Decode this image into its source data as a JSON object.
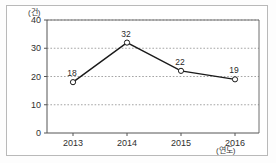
{
  "chart_data": {
    "type": "line",
    "title": "",
    "subtitle": "",
    "xlabel": "(연도)",
    "ylabel": "(건)",
    "categories": [
      "2013",
      "2014",
      "2015",
      "2016"
    ],
    "values": [
      18,
      32,
      22,
      19
    ],
    "series": [
      {
        "name": "건수",
        "values": [
          18,
          32,
          22,
          19
        ]
      }
    ],
    "point_labels": [
      "18",
      "32",
      "22",
      "19"
    ],
    "ylim": [
      0,
      40
    ],
    "yticks": [
      0,
      10,
      20,
      30,
      40
    ],
    "ytick_labels": [
      "0",
      "10",
      "20",
      "30",
      "40"
    ],
    "grid": true,
    "grid_style": "dotted-horizontal",
    "legend": "none",
    "marker": "open-circle",
    "line_color": "#1a1a1a",
    "grid_color": "#9a9a9a",
    "axis_color": "#4a4a4a",
    "background_color": "#ffffff"
  },
  "axes": {
    "y_unit": "(건)",
    "x_unit": "(연도)"
  }
}
